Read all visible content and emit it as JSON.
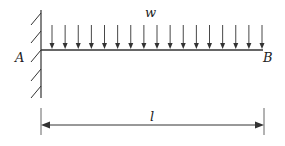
{
  "diagram": {
    "type": "cantilever-beam-uniform-load",
    "labels": {
      "load": "w",
      "fixed_end": "A",
      "free_end": "B",
      "length": "l"
    },
    "colors": {
      "stroke": "#333333",
      "text": "#222222",
      "background": "#ffffff"
    },
    "load_arrow_count": 17
  }
}
